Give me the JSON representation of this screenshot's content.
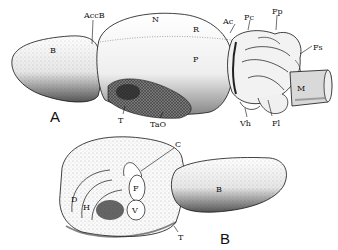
{
  "figure": {
    "panels": [
      {
        "id": "A",
        "title": "A",
        "labels": {
          "B": "B",
          "AccB": "AccB",
          "N": "N",
          "R": "R",
          "P": "P",
          "Ac": "Ac",
          "Pc": "Pc",
          "Fp": "Fp",
          "Fs": "Fs",
          "M": "M",
          "T": "T",
          "TaO": "TaO",
          "Vh": "Vh",
          "Fl": "Fl"
        }
      },
      {
        "id": "B",
        "title": "B",
        "labels": {
          "C": "C",
          "F": "F",
          "V": "V",
          "D": "D",
          "H": "H",
          "B": "B",
          "T": "T"
        }
      }
    ]
  }
}
